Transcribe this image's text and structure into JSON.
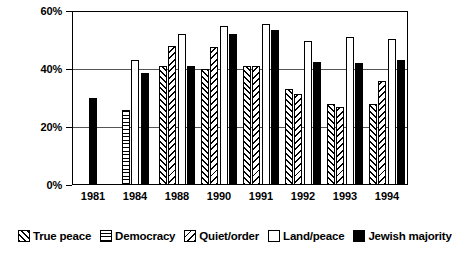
{
  "chart_data": {
    "type": "bar",
    "title": "",
    "subtitle": "",
    "xlabel": "",
    "ylabel": "",
    "categories": [
      "1981",
      "1984",
      "1988",
      "1990",
      "1991",
      "1992",
      "1993",
      "1994"
    ],
    "series": [
      {
        "name": "True peace",
        "pattern": "diagonal-hatch-up",
        "color": "#ffffff",
        "values": [
          null,
          null,
          41,
          40,
          41,
          33,
          28,
          28
        ]
      },
      {
        "name": "Democracy",
        "pattern": "cross-hatch-grid",
        "color": "#ffffff",
        "values": [
          null,
          26,
          null,
          null,
          null,
          null,
          null,
          null
        ]
      },
      {
        "name": "Quiet/order",
        "pattern": "diagonal-hatch-down",
        "color": "#ffffff",
        "values": [
          null,
          null,
          48,
          47.5,
          41,
          31.5,
          27,
          36
        ]
      },
      {
        "name": "Land/peace",
        "pattern": "solid-white",
        "color": "#ffffff",
        "values": [
          null,
          43,
          52,
          55,
          55.5,
          49.5,
          51,
          50.5
        ]
      },
      {
        "name": "Jewish majority",
        "pattern": "solid-black",
        "color": "#000000",
        "values": [
          30,
          38.5,
          41,
          52,
          53.5,
          42.5,
          42,
          43
        ]
      }
    ],
    "ylim": [
      0,
      60
    ],
    "yticks": [
      0,
      20,
      40,
      60
    ],
    "ytick_labels": [
      "0%",
      "20%",
      "40%",
      "60%"
    ],
    "grid": true,
    "grid_axis": "y",
    "legend_position": "bottom",
    "value_unit": "%"
  },
  "legend": {
    "items": [
      {
        "label": "True peace",
        "swatch": "diagonal-hatch-up-swatch"
      },
      {
        "label": "Democracy",
        "swatch": "cross-hatch-grid-swatch"
      },
      {
        "label": "Quiet/order",
        "swatch": "diagonal-hatch-down-swatch"
      },
      {
        "label": "Land/peace",
        "swatch": "solid-white-swatch"
      },
      {
        "label": "Jewish majority",
        "swatch": "solid-black-swatch"
      }
    ]
  }
}
